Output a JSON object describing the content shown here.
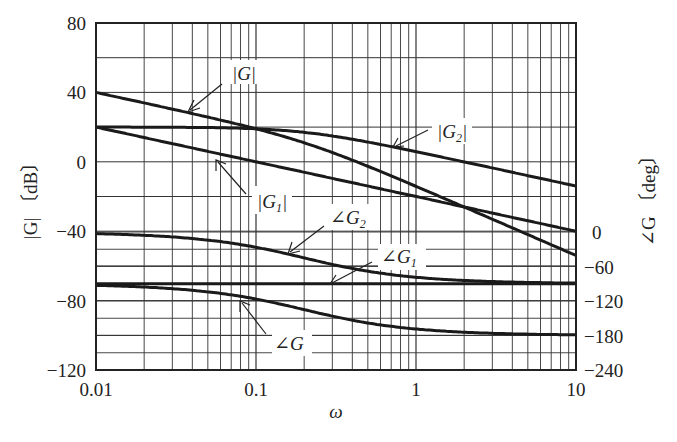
{
  "chart_data": {
    "type": "line",
    "title": "",
    "xlabel": "ω",
    "ylabel_left": "|G| [dB]",
    "ylabel_right": "∠G [deg]",
    "xscale": "log",
    "xlim": [
      0.01,
      10
    ],
    "ylim_left": [
      -120,
      80
    ],
    "ylim_right": [
      -240,
      0
    ],
    "x_ticks": [
      "0.01",
      "0.1",
      "1",
      "10"
    ],
    "y_ticks_left": [
      "80",
      "40",
      "0",
      "−40",
      "−80",
      "−120"
    ],
    "y_ticks_right": [
      "0",
      "−60",
      "−120",
      "−180",
      "−240"
    ],
    "grid": true,
    "x": [
      0.01,
      0.02,
      0.05,
      0.1,
      0.2,
      0.5,
      1,
      2,
      5,
      10
    ],
    "series": [
      {
        "name": "|G|",
        "axis": "left",
        "values": [
          40.0,
          33.9,
          25.1,
          19.0,
          10.0,
          -4.6,
          -14.2,
          -26.0,
          -41.9,
          -54.0
        ]
      },
      {
        "name": "|G1|",
        "axis": "left",
        "values": [
          20,
          14,
          6,
          0,
          -6,
          -14,
          -20,
          -26,
          -34,
          -40
        ]
      },
      {
        "name": "|G2|",
        "axis": "left",
        "values": [
          20.0,
          19.9,
          19.0,
          19.0,
          17.0,
          9.4,
          5.8,
          0.0,
          -8.0,
          -14.0
        ]
      },
      {
        "name": "∠G2",
        "axis": "right",
        "values": [
          -2.9,
          -5.7,
          -14.0,
          -26.6,
          -45.0,
          -68.2,
          -78.7,
          -84.3,
          -87.7,
          -88.9
        ]
      },
      {
        "name": "∠G1",
        "axis": "right",
        "values": [
          -90,
          -90,
          -90,
          -90,
          -90,
          -90,
          -90,
          -90,
          -90,
          -90
        ]
      },
      {
        "name": "∠G",
        "axis": "right",
        "values": [
          -92.9,
          -95.7,
          -104.0,
          -116.6,
          -135.0,
          -158.2,
          -168.7,
          -174.3,
          -177.7,
          -178.9
        ]
      }
    ],
    "annotations": [
      {
        "text": "|G|",
        "target": "|G|"
      },
      {
        "text": "|G2|",
        "target": "|G2|"
      },
      {
        "text": "|G1|",
        "target": "|G1|"
      },
      {
        "text": "∠G2",
        "target": "∠G2"
      },
      {
        "text": "∠G1",
        "target": "∠G1"
      },
      {
        "text": "∠G",
        "target": "∠G"
      }
    ]
  },
  "labels": {
    "xlabel": "ω",
    "ylabel_left": "|G| 〔dB〕",
    "ylabel_right": "∠G 〔deg〕",
    "ann_G": "|G|",
    "ann_G2": "|G",
    "ann_G2_sub": "2",
    "ann_G1": "|G",
    "ann_G1_sub": "1",
    "ann_angG2": "∠G",
    "ann_angG2_sub": "2",
    "ann_angG1": "∠G",
    "ann_angG1_sub": "1",
    "ann_angG": "∠G"
  }
}
